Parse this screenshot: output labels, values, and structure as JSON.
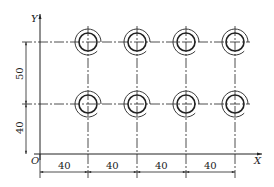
{
  "diagram": {
    "type": "technical-drawing",
    "axes": {
      "x_label": "X",
      "y_label": "Y",
      "origin_label": "O"
    },
    "dimensions": {
      "horizontal": [
        "40",
        "40",
        "40",
        "40"
      ],
      "vertical": [
        "40",
        "50"
      ]
    },
    "holes": {
      "rows": 2,
      "columns": 4,
      "x_positions_mm": [
        40,
        80,
        120,
        160
      ],
      "y_positions_mm": [
        40,
        90
      ]
    },
    "colors": {
      "line": "#222222",
      "background": "#ffffff"
    }
  }
}
